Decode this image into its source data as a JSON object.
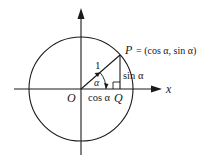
{
  "diagram": {
    "labels": {
      "origin": "O",
      "point_p": "P",
      "p_eq": "= (cos α, sin α)",
      "point_q": "Q",
      "x_axis": "x",
      "radius": "1",
      "angle": "α",
      "adjacent": "cos α",
      "opposite": "sin α"
    },
    "colors": {
      "stroke": "#1a1a1a",
      "background": "#ffffff"
    }
  }
}
